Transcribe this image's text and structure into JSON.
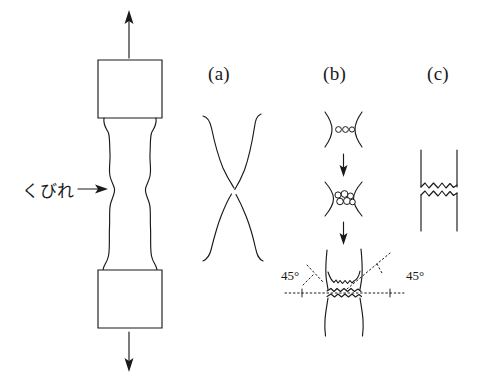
{
  "figure": {
    "background_color": "#ffffff",
    "ink_color": "#1a1a1a"
  },
  "specimen": {
    "name": "tensile-test-specimen",
    "neck_label": "くびれ",
    "neck_label_meaning": "necking",
    "load_arrow_up": "tensile-load-up",
    "load_arrow_down": "tensile-load-down",
    "pointer": "arrow-right"
  },
  "panels": [
    {
      "id": "a",
      "label": "(a)",
      "name": "panel-a-point-fracture"
    },
    {
      "id": "b",
      "label": "(b)",
      "name": "panel-b-cup-and-cone-fracture",
      "stages": [
        {
          "name": "void-nucleation",
          "void_count": 3
        },
        {
          "name": "void-coalescence",
          "void_count": 6
        },
        {
          "name": "shear-lip-fracture"
        }
      ],
      "angles": {
        "left": "45°",
        "right": "45°"
      }
    },
    {
      "id": "c",
      "label": "(c)",
      "name": "panel-c-brittle-fracture"
    }
  ]
}
